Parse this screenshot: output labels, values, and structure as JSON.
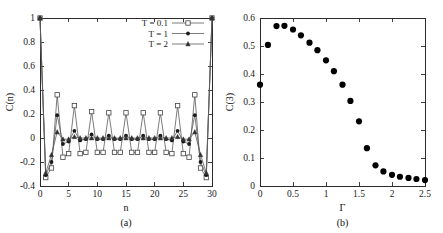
{
  "figure": {
    "panels": [
      "(a)",
      "(b)"
    ]
  },
  "chart_data": [
    {
      "id": "panel-a",
      "type": "line",
      "title": "",
      "panel_label": "(a)",
      "xlabel": "n",
      "ylabel": "C(n)",
      "xlim": [
        0,
        30
      ],
      "ylim": [
        -0.4,
        1.0
      ],
      "xticks": [
        0,
        5,
        10,
        15,
        20,
        25,
        30
      ],
      "xticklabels": [
        "0",
        "5",
        "10",
        "15",
        "20",
        "25",
        "30"
      ],
      "yticks": [
        -0.4,
        -0.2,
        0,
        0.2,
        0.4,
        0.6,
        0.8,
        1.0
      ],
      "yticklabels": [
        "-0.4",
        "-0.2",
        "0",
        "0.2",
        "0.4",
        "0.6",
        "0.8",
        "1"
      ],
      "grid": false,
      "legend_position": "top-right",
      "x": [
        0,
        1,
        2,
        3,
        4,
        5,
        6,
        7,
        8,
        9,
        10,
        11,
        12,
        13,
        14,
        15,
        16,
        17,
        18,
        19,
        20,
        21,
        22,
        23,
        24,
        25,
        26,
        27,
        28,
        29,
        30
      ],
      "series": [
        {
          "name": "T = 0.1",
          "marker": "open-square",
          "values": [
            1.0,
            -0.33,
            -0.25,
            0.36,
            -0.16,
            -0.13,
            0.27,
            -0.13,
            -0.12,
            0.22,
            -0.12,
            -0.12,
            0.21,
            -0.12,
            -0.12,
            0.21,
            -0.12,
            -0.12,
            0.21,
            -0.12,
            -0.12,
            0.21,
            -0.12,
            -0.13,
            0.27,
            -0.13,
            -0.16,
            0.36,
            -0.25,
            -0.33,
            1.0
          ]
        },
        {
          "name": "T = 1",
          "marker": "filled-circle",
          "values": [
            1.0,
            -0.31,
            -0.2,
            0.19,
            -0.05,
            -0.03,
            0.06,
            -0.02,
            -0.01,
            0.03,
            -0.01,
            -0.01,
            0.02,
            -0.01,
            -0.01,
            0.02,
            -0.01,
            -0.01,
            0.02,
            -0.01,
            -0.01,
            0.02,
            -0.01,
            -0.02,
            0.06,
            -0.03,
            -0.05,
            0.19,
            -0.2,
            -0.31,
            1.0
          ]
        },
        {
          "name": "T = 2",
          "marker": "triangle",
          "values": [
            1.0,
            -0.29,
            -0.14,
            0.05,
            -0.01,
            -0.01,
            0.01,
            0.0,
            0.0,
            0.0,
            0.0,
            0.0,
            0.0,
            0.0,
            0.0,
            0.0,
            0.0,
            0.0,
            0.0,
            0.0,
            0.0,
            0.0,
            0.0,
            0.0,
            0.01,
            -0.01,
            -0.01,
            0.05,
            -0.14,
            -0.29,
            1.0
          ]
        }
      ]
    },
    {
      "id": "panel-b",
      "type": "scatter",
      "title": "",
      "panel_label": "(b)",
      "xlabel": "Γ",
      "ylabel": "C(3)",
      "xlim": [
        0,
        2.5
      ],
      "ylim": [
        0,
        0.6
      ],
      "xticks": [
        0,
        0.5,
        1,
        1.5,
        2,
        2.5
      ],
      "xticklabels": [
        "0",
        "0.5",
        "1",
        "1.5",
        "2",
        "2.5"
      ],
      "yticks": [
        0,
        0.1,
        0.2,
        0.3,
        0.4,
        0.5,
        0.6
      ],
      "yticklabels": [
        "0",
        "0.1",
        "0.2",
        "0.3",
        "0.4",
        "0.5",
        "0.6"
      ],
      "grid": false,
      "marker": "filled-circle",
      "x": [
        0.0,
        0.12,
        0.25,
        0.37,
        0.5,
        0.62,
        0.75,
        0.87,
        1.0,
        1.12,
        1.25,
        1.37,
        1.5,
        1.62,
        1.75,
        1.87,
        2.0,
        2.12,
        2.25,
        2.37,
        2.5
      ],
      "values": [
        0.362,
        0.504,
        0.571,
        0.572,
        0.559,
        0.538,
        0.512,
        0.485,
        0.449,
        0.41,
        0.362,
        0.304,
        0.231,
        0.135,
        0.074,
        0.052,
        0.04,
        0.033,
        0.029,
        0.025,
        0.021
      ]
    }
  ]
}
